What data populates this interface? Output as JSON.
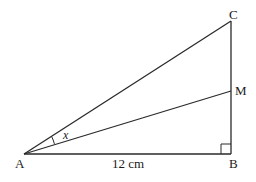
{
  "diagram": {
    "type": "right-triangle",
    "points": {
      "A": {
        "label": "A",
        "x": 24,
        "y": 154
      },
      "B": {
        "label": "B",
        "x": 231,
        "y": 154
      },
      "C": {
        "label": "C",
        "x": 231,
        "y": 21
      },
      "M": {
        "label": "M",
        "x": 231,
        "y": 91
      }
    },
    "segments": [
      "AB",
      "BC",
      "AC",
      "AM"
    ],
    "right_angle_at": "B",
    "angle_label": "x",
    "angle_between": [
      "AC",
      "AM"
    ],
    "side_label_AB": "12 cm",
    "line_color": "#2a2a2a"
  }
}
